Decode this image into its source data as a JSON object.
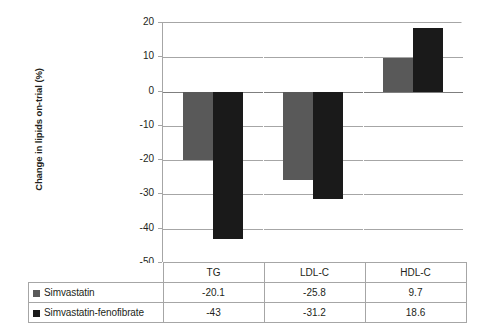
{
  "chart_data": {
    "type": "bar",
    "title": "",
    "xlabel": "",
    "ylabel": "Change in lipids on-trial (%)",
    "categories": [
      "TG",
      "LDL-C",
      "HDL-C"
    ],
    "series": [
      {
        "name": "Simvastatin",
        "color": "#595959",
        "values": [
          -20.1,
          -25.8,
          9.7
        ]
      },
      {
        "name": "Simvastatin-fenofibrate",
        "color": "#1a1a1a",
        "values": [
          -43,
          -31.2,
          18.6
        ]
      }
    ],
    "ylim": [
      -50,
      20
    ],
    "ytick_labels": [
      "20",
      "10",
      "0",
      "-10",
      "-20",
      "-30",
      "-40",
      "-50"
    ],
    "ytick_values": [
      20,
      10,
      0,
      -10,
      -20,
      -30,
      -40,
      -50
    ],
    "grid": true,
    "legend_position": "bottom-table",
    "value_labels": {
      "Simvastatin": [
        "-20.1",
        "-25.8",
        "9.7"
      ],
      "Simvastatin-fenofibrate": [
        "-43",
        "-31.2",
        "18.6"
      ]
    }
  },
  "table": {
    "header_blank": "",
    "column_headers": [
      "TG",
      "LDL-C",
      "HDL-C"
    ],
    "rows": [
      {
        "label": "Simvastatin",
        "values": [
          "-20.1",
          "-25.8",
          "9.7"
        ]
      },
      {
        "label": "Simvastatin-fenofibrate",
        "values": [
          "-43",
          "-31.2",
          "18.6"
        ]
      }
    ]
  }
}
